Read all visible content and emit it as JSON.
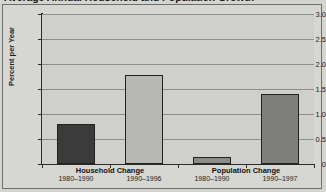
{
  "chart_data": {
    "type": "bar",
    "title": "Average Annual Household and Population Growth",
    "xlabel": "",
    "ylabel": "Percent per Year",
    "ylim": [
      0,
      3.0
    ],
    "ytick_labels": [
      "0",
      "0.5",
      "1.0",
      "1.5",
      "2.0",
      "2.5",
      "3.0"
    ],
    "ytick_values": [
      0,
      0.5,
      1.0,
      1.5,
      2.0,
      2.5,
      3.0
    ],
    "grid": true,
    "legend": "none",
    "categories": [
      "1980–1990",
      "1990–1996",
      "1980–1990",
      "1990–1997"
    ],
    "values": [
      0.8,
      1.78,
      0.15,
      1.4
    ],
    "bar_colors": [
      "#3b3b3b",
      "#b7b7b3",
      "#8b8b87",
      "#7e7e7a"
    ],
    "groups": [
      {
        "label": "Household Change",
        "bars": [
          {
            "period": "1980–1990",
            "value": 0.8,
            "color": "#3b3b3b"
          },
          {
            "period": "1990–1996",
            "value": 1.78,
            "color": "#b7b7b3"
          }
        ]
      },
      {
        "label": "Population Change",
        "bars": [
          {
            "period": "1980–1990",
            "value": 0.15,
            "color": "#8b8b87"
          },
          {
            "period": "1990–1997",
            "value": 1.4,
            "color": "#7e7e7a"
          }
        ]
      }
    ]
  }
}
